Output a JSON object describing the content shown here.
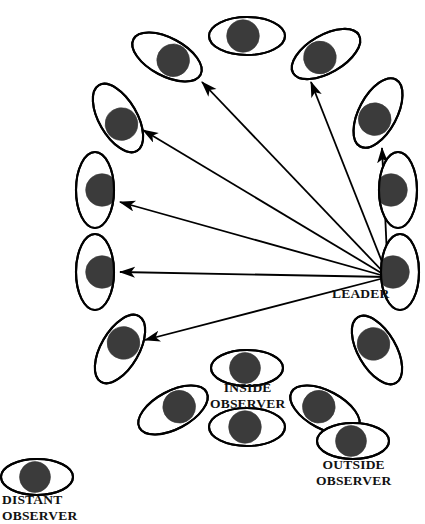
{
  "figure": {
    "type": "diagram",
    "background_color": "#ffffff",
    "stroke_color": "#000000",
    "pupil_color": "#3b3b3b"
  },
  "labels": {
    "leader": "LEADER",
    "inside_observer_line1": "INSIDE",
    "inside_observer_line2": "OBSERVER",
    "outside_observer_line1": "OUTSIDE",
    "outside_observer_line2": "OBSERVER",
    "distant_observer_line1": "DISTANT",
    "distant_observer_line2": "OBSERVER"
  },
  "ring": {
    "center_x": 243,
    "center_y": 244,
    "radius_x": 158,
    "radius_y": 200,
    "count": 14,
    "eyes": [
      {
        "name": "ring-eye-leader",
        "cx": 400,
        "cy": 272,
        "rx": 19,
        "ry": 38,
        "rot": 0,
        "pupil_dx": -7,
        "pupil_dy": 0
      },
      {
        "name": "ring-eye-right-upper",
        "cx": 398,
        "cy": 190,
        "rx": 19,
        "ry": 38,
        "rot": 0,
        "pupil_dx": -7,
        "pupil_dy": 0
      },
      {
        "name": "ring-eye-upper-right-2",
        "cx": 378,
        "cy": 113,
        "rx": 38,
        "ry": 19,
        "rot": -62,
        "pupil_dx": -7,
        "pupil_dy": 0
      },
      {
        "name": "ring-eye-upper-right-1",
        "cx": 326,
        "cy": 54,
        "rx": 38,
        "ry": 19,
        "rot": -30,
        "pupil_dx": -7,
        "pupil_dy": 0
      },
      {
        "name": "ring-eye-top",
        "cx": 247,
        "cy": 36,
        "rx": 38,
        "ry": 19,
        "rot": 0,
        "pupil_dx": -4,
        "pupil_dy": 0
      },
      {
        "name": "ring-eye-upper-left-1",
        "cx": 167,
        "cy": 57,
        "rx": 38,
        "ry": 19,
        "rot": 28,
        "pupil_dx": 7,
        "pupil_dy": 0
      },
      {
        "name": "ring-eye-upper-left-2",
        "cx": 118,
        "cy": 118,
        "rx": 38,
        "ry": 19,
        "rot": 60,
        "pupil_dx": 7,
        "pupil_dy": 0
      },
      {
        "name": "ring-eye-left-upper",
        "cx": 95,
        "cy": 190,
        "rx": 19,
        "ry": 38,
        "rot": 0,
        "pupil_dx": 7,
        "pupil_dy": 0
      },
      {
        "name": "ring-eye-left-lower",
        "cx": 95,
        "cy": 272,
        "rx": 19,
        "ry": 38,
        "rot": 0,
        "pupil_dx": 7,
        "pupil_dy": 0
      },
      {
        "name": "ring-eye-lower-left-2",
        "cx": 120,
        "cy": 349,
        "rx": 38,
        "ry": 19,
        "rot": -60,
        "pupil_dx": 7,
        "pupil_dy": 0
      },
      {
        "name": "ring-eye-lower-left-1",
        "cx": 173,
        "cy": 410,
        "rx": 38,
        "ry": 19,
        "rot": -28,
        "pupil_dx": 7,
        "pupil_dy": 0
      },
      {
        "name": "ring-eye-bottom",
        "cx": 247,
        "cy": 427,
        "rx": 38,
        "ry": 19,
        "rot": 0,
        "pupil_dx": -2,
        "pupil_dy": 0
      },
      {
        "name": "ring-eye-lower-right-1",
        "cx": 325,
        "cy": 410,
        "rx": 38,
        "ry": 19,
        "rot": 28,
        "pupil_dx": -7,
        "pupil_dy": 0
      },
      {
        "name": "ring-eye-lower-right-2",
        "cx": 377,
        "cy": 350,
        "rx": 38,
        "ry": 19,
        "rot": 60,
        "pupil_dx": -7,
        "pupil_dy": 0
      }
    ],
    "observer_eyes": [
      {
        "name": "inside-observer-eye",
        "cx": 247,
        "cy": 368,
        "rx": 36,
        "ry": 18,
        "rot": 0,
        "pupil_dx": -2,
        "pupil_dy": 0
      },
      {
        "name": "outside-observer-eye",
        "cx": 353,
        "cy": 441,
        "rx": 36,
        "ry": 18,
        "rot": 0,
        "pupil_dx": -2,
        "pupil_dy": 0
      },
      {
        "name": "distant-observer-eye",
        "cx": 37,
        "cy": 477,
        "rx": 36,
        "ry": 18,
        "rot": 0,
        "pupil_dx": -2,
        "pupil_dy": 0
      }
    ]
  },
  "arrows": {
    "origin_x": 388,
    "origin_y": 277,
    "items": [
      {
        "name": "gaze-arrow-to-upper-left-1",
        "x1": 388,
        "y1": 277,
        "x2": 202,
        "y2": 82
      },
      {
        "name": "gaze-arrow-to-upper-right-1",
        "x1": 388,
        "y1": 277,
        "x2": 311,
        "y2": 82
      },
      {
        "name": "gaze-arrow-to-right-upper",
        "x1": 388,
        "y1": 277,
        "x2": 382,
        "y2": 148
      },
      {
        "name": "gaze-arrow-to-upper-left-2",
        "x1": 388,
        "y1": 277,
        "x2": 143,
        "y2": 130
      },
      {
        "name": "gaze-arrow-to-left-upper",
        "x1": 388,
        "y1": 277,
        "x2": 120,
        "y2": 202
      },
      {
        "name": "gaze-arrow-to-left-lower",
        "x1": 388,
        "y1": 277,
        "x2": 120,
        "y2": 272
      },
      {
        "name": "gaze-arrow-to-lower-left-2",
        "x1": 388,
        "y1": 277,
        "x2": 145,
        "y2": 340
      }
    ]
  }
}
